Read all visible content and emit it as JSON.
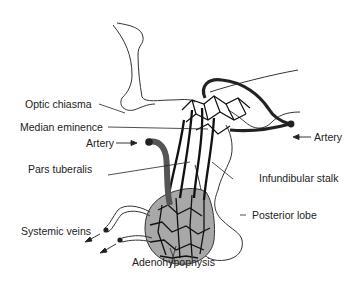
{
  "diagram": {
    "labels": {
      "optic_chiasma": "Optic chiasma",
      "median_eminence": "Median eminence",
      "artery_left": "Artery",
      "pars_tuberalis": "Pars tuberalis",
      "systemic_veins": "Systemic veins",
      "adenohypophysis": "Adenohypophysis",
      "artery_right": "Artery",
      "infundibular_stalk": "Infundibular stalk",
      "posterior_lobe": "Posterior lobe"
    },
    "colors": {
      "outline": "#333333",
      "vessel": "#1a1a1a",
      "gland_fill": "#a8a8a8",
      "artery_fill": "#555555"
    }
  }
}
